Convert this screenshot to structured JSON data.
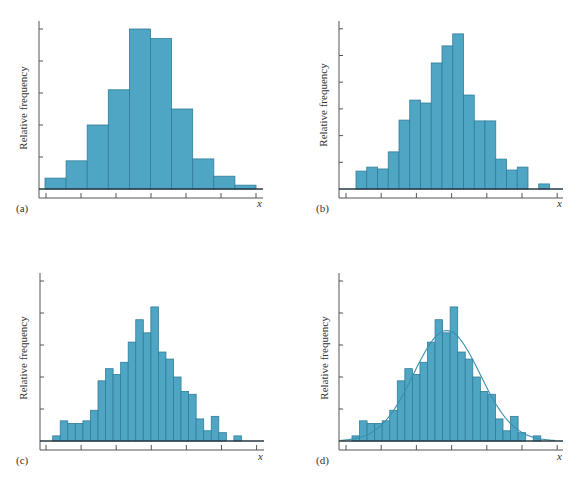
{
  "colors": {
    "bar_fill": "#4fa6c4",
    "bar_edge": "#2f7d9b",
    "curve": "#3a8fae",
    "axis": "#555555"
  },
  "chart_data": [
    {
      "panel": "a",
      "type": "bar",
      "subtype": "histogram",
      "label": "(a)",
      "xlabel": "x",
      "ylabel": "Relative frequency",
      "y_units": "tick intervals",
      "y_ticks": 5,
      "x_ticks": 7,
      "tick_labels": false,
      "bins": 10,
      "values": [
        0.34,
        0.88,
        2.0,
        3.1,
        5.0,
        4.7,
        2.5,
        0.94,
        0.4,
        0.12
      ],
      "layout": {
        "axis_x": 39,
        "baseline_y": 189,
        "axis_top": 21,
        "axis_bottom": 198,
        "axis_end": 263,
        "bar_start": 45,
        "bar_width": 21.1,
        "tick_px": 32,
        "xtick_start": 46,
        "xtick_step": 35,
        "label_pos": [
          16,
          212
        ],
        "x_label_pos": [
          257,
          207
        ],
        "ylabel_pos": [
          27,
          108
        ]
      }
    },
    {
      "panel": "b",
      "type": "bar",
      "subtype": "histogram",
      "label": "(b)",
      "xlabel": "x",
      "ylabel": "Relative frequency",
      "y_units": "tick intervals",
      "y_ticks": 6,
      "x_ticks": 7,
      "tick_labels": false,
      "bins": 18,
      "values": [
        0.67,
        0.82,
        0.75,
        1.39,
        2.58,
        3.33,
        3.22,
        4.72,
        5.36,
        5.81,
        3.52,
        2.55,
        2.55,
        1.12,
        0.71,
        0.82,
        0,
        0.19
      ],
      "layout": {
        "axis_x": 339,
        "baseline_y": 189,
        "axis_top": 21,
        "axis_bottom": 198,
        "axis_end": 563,
        "bar_start": 356,
        "bar_width": 10.75,
        "tick_px": 26.7,
        "xtick_start": 346,
        "xtick_step": 35.2,
        "label_pos": [
          316,
          212
        ],
        "x_label_pos": [
          557,
          207
        ],
        "ylabel_pos": [
          327,
          105
        ]
      }
    },
    {
      "panel": "c",
      "type": "bar",
      "subtype": "histogram",
      "label": "(c)",
      "xlabel": "x",
      "ylabel": "Relative frequency",
      "y_units": "tick intervals",
      "y_ticks": 5,
      "x_ticks": 7,
      "tick_labels": false,
      "bins": 25,
      "values": [
        0.16,
        0.63,
        0.55,
        0.55,
        0.63,
        0.96,
        1.88,
        2.26,
        2.08,
        2.46,
        3.09,
        3.79,
        3.38,
        4.19,
        2.78,
        2.56,
        2.0,
        1.55,
        1.46,
        0.69,
        0.32,
        0.77,
        0.26,
        0,
        0.16
      ],
      "layout": {
        "axis_x": 40,
        "baseline_y": 441,
        "axis_top": 273,
        "axis_bottom": 450,
        "axis_end": 264,
        "bar_start": 52.7,
        "bar_width": 7.55,
        "tick_px": 32,
        "xtick_start": 46,
        "xtick_step": 35.1,
        "label_pos": [
          16,
          464
        ],
        "x_label_pos": [
          258,
          460
        ],
        "ylabel_pos": [
          27,
          358
        ]
      }
    },
    {
      "panel": "d",
      "type": "bar",
      "subtype": "histogram with fitted normal curve",
      "label": "(d)",
      "xlabel": "x",
      "ylabel": "Relative frequency",
      "y_units": "tick intervals",
      "y_ticks": 5,
      "x_ticks": 7,
      "tick_labels": false,
      "bins": 25,
      "values": [
        0.16,
        0.63,
        0.55,
        0.55,
        0.63,
        0.96,
        1.88,
        2.26,
        2.08,
        2.46,
        3.09,
        3.79,
        3.38,
        4.19,
        2.78,
        2.56,
        2.0,
        1.55,
        1.46,
        0.69,
        0.32,
        0.77,
        0.26,
        0,
        0.16
      ],
      "curve": {
        "type": "normal",
        "mean_bin": 12.05,
        "sd_bins": 4.4,
        "peak": 3.45
      },
      "layout": {
        "axis_x": 339,
        "baseline_y": 441,
        "axis_top": 273,
        "axis_bottom": 450,
        "axis_end": 563,
        "bar_start": 352,
        "bar_width": 7.55,
        "tick_px": 32,
        "xtick_start": 346,
        "xtick_step": 35.2,
        "label_pos": [
          316,
          464
        ],
        "x_label_pos": [
          557,
          460
        ],
        "ylabel_pos": [
          328,
          358
        ]
      }
    }
  ]
}
